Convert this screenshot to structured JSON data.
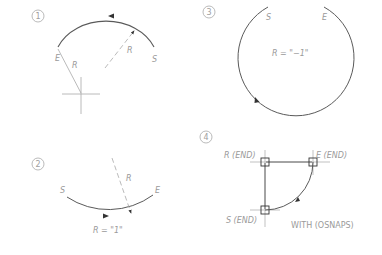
{
  "panels": [
    {
      "number": "1",
      "labels": {
        "start": "S",
        "end": "E",
        "radius_solid": "R",
        "radius_dashed": "R"
      }
    },
    {
      "number": "2",
      "labels": {
        "start": "S",
        "end": "E",
        "radius": "R",
        "caption": "R = \"1\""
      }
    },
    {
      "number": "3",
      "labels": {
        "start": "S",
        "end": "E",
        "caption": "R = \"−1\""
      }
    },
    {
      "number": "4",
      "labels": {
        "radius": "R (END)",
        "end": "E (END)",
        "start": "S (END)",
        "caption": "WITH (OSNAPS)"
      }
    }
  ],
  "colors": {
    "line": "#5a5a5a",
    "text": "#9a9a9a",
    "construction": "#a8a8a8"
  }
}
